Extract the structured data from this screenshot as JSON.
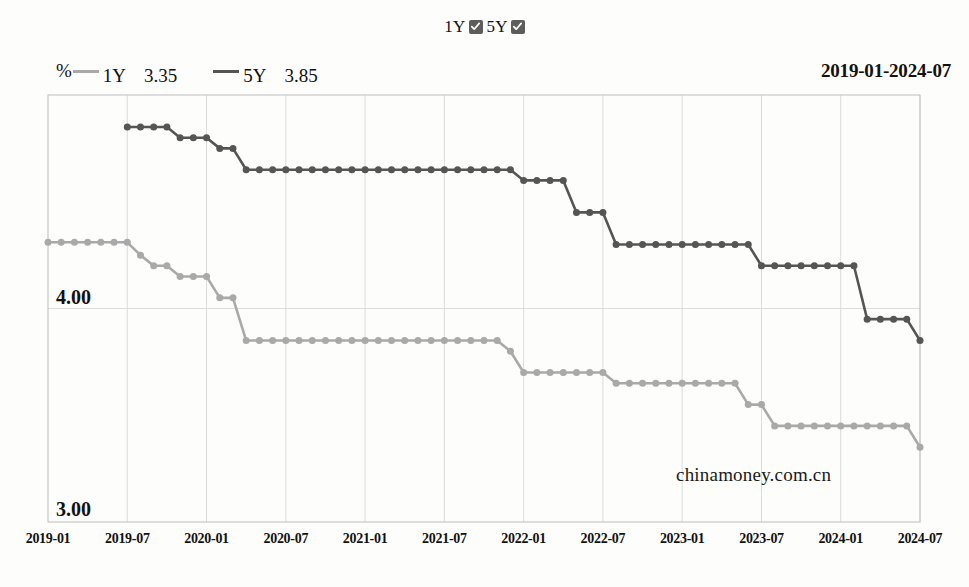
{
  "toggles": [
    {
      "label": "1Y",
      "checked": true,
      "icon": "checkbox-checked-icon"
    },
    {
      "label": "5Y",
      "checked": true,
      "icon": "checkbox-checked-icon"
    }
  ],
  "legend": {
    "unit": "%",
    "items": [
      {
        "name": "1Y",
        "value": "3.35",
        "color": "#a9a9a9"
      },
      {
        "name": "5Y",
        "value": "3.85",
        "color": "#555555"
      }
    ]
  },
  "date_range": "2019-01-2024-07",
  "watermark": "chinamoney.com.cn",
  "y_labels": {
    "top": "4.00",
    "bottom": "3.00"
  },
  "chart_data": {
    "type": "line",
    "title": "",
    "xlabel": "",
    "ylabel": "%",
    "ylim": [
      3.0,
      5.0
    ],
    "y_ticks": [
      3.0,
      4.0
    ],
    "grid": true,
    "legend_position": "top-left",
    "x_tick_labels": [
      "2019-01",
      "2019-07",
      "2020-01",
      "2020-07",
      "2021-01",
      "2021-07",
      "2022-01",
      "2022-07",
      "2023-01",
      "2023-07",
      "2024-01",
      "2024-07"
    ],
    "x_start": "2019-01",
    "x_end": "2024-07",
    "x": [
      "2019-01",
      "2019-02",
      "2019-03",
      "2019-04",
      "2019-05",
      "2019-06",
      "2019-07",
      "2019-08",
      "2019-09",
      "2019-10",
      "2019-11",
      "2019-12",
      "2020-01",
      "2020-02",
      "2020-03",
      "2020-04",
      "2020-05",
      "2020-06",
      "2020-07",
      "2020-08",
      "2020-09",
      "2020-10",
      "2020-11",
      "2020-12",
      "2021-01",
      "2021-02",
      "2021-03",
      "2021-04",
      "2021-05",
      "2021-06",
      "2021-07",
      "2021-08",
      "2021-09",
      "2021-10",
      "2021-11",
      "2021-12",
      "2022-01",
      "2022-02",
      "2022-03",
      "2022-04",
      "2022-05",
      "2022-06",
      "2022-07",
      "2022-08",
      "2022-09",
      "2022-10",
      "2022-11",
      "2022-12",
      "2023-01",
      "2023-02",
      "2023-03",
      "2023-04",
      "2023-05",
      "2023-06",
      "2023-07",
      "2023-08",
      "2023-09",
      "2023-10",
      "2023-11",
      "2023-12",
      "2024-01",
      "2024-02",
      "2024-03",
      "2024-04",
      "2024-05",
      "2024-06",
      "2024-07"
    ],
    "series": [
      {
        "name": "1Y",
        "color": "#a9a9a9",
        "marker": "circle",
        "values": [
          4.31,
          4.31,
          4.31,
          4.31,
          4.31,
          4.31,
          4.31,
          4.25,
          4.2,
          4.2,
          4.15,
          4.15,
          4.15,
          4.05,
          4.05,
          3.85,
          3.85,
          3.85,
          3.85,
          3.85,
          3.85,
          3.85,
          3.85,
          3.85,
          3.85,
          3.85,
          3.85,
          3.85,
          3.85,
          3.85,
          3.85,
          3.85,
          3.85,
          3.85,
          3.85,
          3.8,
          3.7,
          3.7,
          3.7,
          3.7,
          3.7,
          3.7,
          3.7,
          3.65,
          3.65,
          3.65,
          3.65,
          3.65,
          3.65,
          3.65,
          3.65,
          3.65,
          3.65,
          3.55,
          3.55,
          3.45,
          3.45,
          3.45,
          3.45,
          3.45,
          3.45,
          3.45,
          3.45,
          3.45,
          3.45,
          3.45,
          3.35
        ]
      },
      {
        "name": "5Y",
        "color": "#555555",
        "marker": "circle",
        "values": [
          null,
          null,
          null,
          null,
          null,
          null,
          4.85,
          4.85,
          4.85,
          4.85,
          4.8,
          4.8,
          4.8,
          4.75,
          4.75,
          4.65,
          4.65,
          4.65,
          4.65,
          4.65,
          4.65,
          4.65,
          4.65,
          4.65,
          4.65,
          4.65,
          4.65,
          4.65,
          4.65,
          4.65,
          4.65,
          4.65,
          4.65,
          4.65,
          4.65,
          4.65,
          4.6,
          4.6,
          4.6,
          4.6,
          4.45,
          4.45,
          4.45,
          4.3,
          4.3,
          4.3,
          4.3,
          4.3,
          4.3,
          4.3,
          4.3,
          4.3,
          4.3,
          4.3,
          4.2,
          4.2,
          4.2,
          4.2,
          4.2,
          4.2,
          4.2,
          4.2,
          3.95,
          3.95,
          3.95,
          3.95,
          3.85
        ]
      }
    ]
  }
}
